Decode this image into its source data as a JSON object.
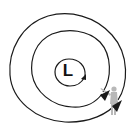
{
  "diagram": {
    "type": "low-pressure-system",
    "center_label": "L",
    "isobars": [
      {
        "name": "inner",
        "shape": "circle"
      },
      {
        "name": "middle",
        "shape": "loop"
      },
      {
        "name": "outer",
        "shape": "loop"
      }
    ],
    "flow_direction": "counterclockwise",
    "arrows": 3,
    "figure": "person-pointing",
    "colors": {
      "line": "#1a1a1a",
      "figure": "#b8b8b8",
      "background": "#ffffff"
    }
  }
}
